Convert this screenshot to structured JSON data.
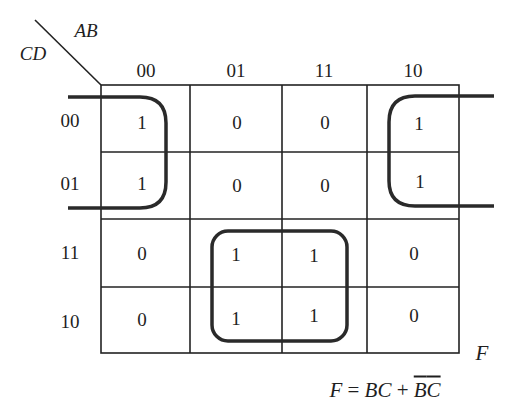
{
  "diagram": {
    "type": "karnaugh-map",
    "corner": {
      "col_var": "AB",
      "row_var": "CD"
    },
    "col_labels": [
      "00",
      "01",
      "11",
      "10"
    ],
    "row_labels": [
      "00",
      "01",
      "11",
      "10"
    ],
    "cells": [
      [
        "1",
        "0",
        "0",
        "1"
      ],
      [
        "1",
        "0",
        "0",
        "1"
      ],
      [
        "0",
        "1",
        "1",
        "0"
      ],
      [
        "0",
        "1",
        "1",
        "0"
      ]
    ],
    "function_label": "F",
    "groups": [
      {
        "name": "B'C' wrap-around group",
        "cells": [
          [
            0,
            0
          ],
          [
            1,
            0
          ],
          [
            0,
            3
          ],
          [
            1,
            3
          ]
        ]
      },
      {
        "name": "BC group",
        "cells": [
          [
            2,
            1
          ],
          [
            2,
            2
          ],
          [
            3,
            1
          ],
          [
            3,
            2
          ]
        ]
      }
    ],
    "equation": {
      "lhs": "F",
      "eq": " = ",
      "t1": "BC",
      "plus": " + ",
      "t2a": "B",
      "t2b": "C"
    }
  }
}
